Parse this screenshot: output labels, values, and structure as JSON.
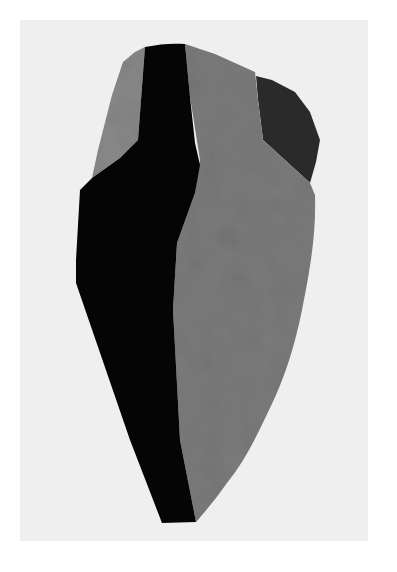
{
  "image": {
    "subject": "abstract faceted sculpture",
    "style": "grayscale photograph",
    "colors": {
      "border": "#ffffff",
      "background": "#efefef",
      "black_facet": "#050505",
      "gray_facet": "#7c7c7c",
      "left_gray_facet": "#8a8a8a",
      "dark_facet": "#2a2a2a"
    }
  }
}
